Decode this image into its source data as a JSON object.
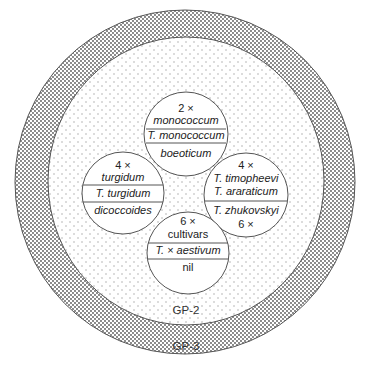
{
  "diagram": {
    "type": "gene-pool-concentric-diagram",
    "outer_ring": {
      "label": "GP-3",
      "pattern": "dense-dots"
    },
    "middle_area": {
      "label": "GP-2",
      "pattern": "sparse-dots"
    },
    "circles": [
      {
        "id": "top",
        "ploidy": "2 ×",
        "cultivated": "monococcum",
        "species": "T. monococcum",
        "wild": "boeoticum"
      },
      {
        "id": "left",
        "ploidy": "4 ×",
        "cultivated": "turgidum",
        "species": "T. turgidum",
        "wild": "dicoccoides"
      },
      {
        "id": "right",
        "ploidy": "4 ×",
        "species_1": "T. timopheevi",
        "species_2": "T. araraticum",
        "species_3": "T. zhukovskyi",
        "ploidy_2": "6 ×"
      },
      {
        "id": "bottom",
        "ploidy": "6 ×",
        "cultivated": "cultivars",
        "species_prefix": "T.",
        "species_cross": "×",
        "species_name": "aestivum",
        "wild": "nil"
      }
    ],
    "colors": {
      "line": "#555555",
      "dot_dense": "#555555",
      "dot_sparse": "#9a9a9a",
      "background": "#ffffff"
    }
  }
}
